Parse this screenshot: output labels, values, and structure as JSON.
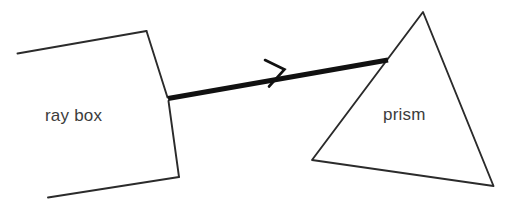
{
  "diagram": {
    "background_color": "#ffffff",
    "stroke_color": "#2b2b2b",
    "beam_color": "#111111",
    "text_color": "#3c3c3c",
    "labels": {
      "ray_box": "ray box",
      "prism": "prism"
    },
    "shapes": {
      "ray_box": {
        "name": "ray-box-open-quadrilateral",
        "top_edge": "17,53 146,31",
        "right_edge_upper": "146,31 168,98",
        "right_edge_lower": "168,98 179,177",
        "bottom_edge": "179,177 48,197"
      },
      "prism": {
        "name": "prism-triangle",
        "apex": "423,12",
        "bottom_left": "312,160",
        "bottom_right": "493,186"
      },
      "beam": {
        "name": "light-beam",
        "start": "168,98",
        "end": "388,60",
        "width_px": 5
      },
      "arrowhead": {
        "name": "beam-direction-arrowhead",
        "tip": "284,69",
        "upper_leg": "265,60",
        "lower_leg": "269,86"
      }
    }
  }
}
